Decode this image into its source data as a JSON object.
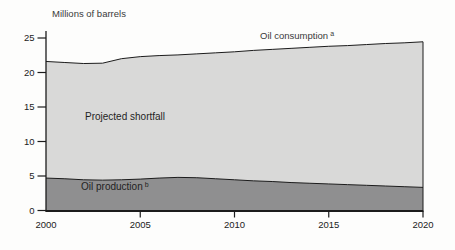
{
  "title": "Millions of barrels",
  "labels": {
    "consumption": {
      "text": "Oil consumption",
      "sup": "a"
    },
    "shortfall": {
      "text": "Projected shortfall"
    },
    "production": {
      "text": "Oil production",
      "sup": "b"
    }
  },
  "colors": {
    "shortfall_fill": "#d9d9d8",
    "production_fill": "#8f8f90",
    "line": "#1c1c1c",
    "axis": "#1c1c1c",
    "text": "#2a2a2a",
    "background": "#fdfdfc"
  },
  "chart_data": {
    "type": "area",
    "title": "Millions of barrels",
    "x": [
      2000,
      2001,
      2002,
      2003,
      2004,
      2005,
      2006,
      2007,
      2008,
      2009,
      2010,
      2011,
      2012,
      2013,
      2014,
      2015,
      2016,
      2017,
      2018,
      2019,
      2020
    ],
    "series": [
      {
        "name": "Oil consumption",
        "values": [
          21.6,
          21.45,
          21.3,
          21.35,
          22.0,
          22.3,
          22.45,
          22.55,
          22.7,
          22.85,
          23.0,
          23.2,
          23.35,
          23.5,
          23.65,
          23.8,
          23.9,
          24.05,
          24.2,
          24.3,
          24.45
        ]
      },
      {
        "name": "Oil production",
        "values": [
          4.7,
          4.6,
          4.45,
          4.4,
          4.45,
          4.55,
          4.7,
          4.8,
          4.75,
          4.6,
          4.45,
          4.3,
          4.2,
          4.05,
          3.95,
          3.85,
          3.75,
          3.65,
          3.55,
          3.45,
          3.35
        ]
      }
    ],
    "annotations": [
      "Projected shortfall is the gap between oil consumption and oil production"
    ],
    "xlim": [
      2000,
      2020
    ],
    "ylim": [
      0,
      25
    ],
    "yticks": [
      0,
      5,
      10,
      15,
      20,
      25
    ],
    "xticks": [
      2000,
      2005,
      2010,
      2015,
      2020
    ],
    "ylabel": "Millions of barrels",
    "xlabel": "",
    "grid": false,
    "legend_position": "inline"
  }
}
